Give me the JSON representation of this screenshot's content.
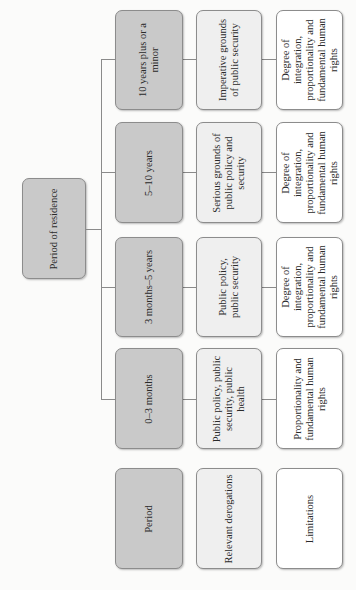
{
  "root": {
    "label": "Period of residence"
  },
  "rows": [
    {
      "period": "10 years plus or a minor",
      "derogation": "Imperative grounds of public security",
      "limitation": "Degree of integration, proportionality and fundamental human rights"
    },
    {
      "period": "5–10 years",
      "derogation": "Serious grounds of public policy and security",
      "limitation": "Degree of integration, proportionality and fundamental human rights"
    },
    {
      "period": "3 months–5 years",
      "derogation": "Public policy, public security",
      "limitation": "Degree of integration, proportionality and fundamental human rights"
    },
    {
      "period": "0–3 months",
      "derogation": "Public policy, public security, public health",
      "limitation": "Proportionality and fundamental human rights"
    }
  ],
  "legend": {
    "period": "Period",
    "derogation": "Relevant derogations",
    "limitation": "Limitations"
  },
  "colors": {
    "period_fill": "#c9c9c9",
    "derogation_fill": "#efefef",
    "limitation_fill": "#ffffff",
    "border": "#8c8c8c",
    "connector": "#8a8a8a"
  }
}
